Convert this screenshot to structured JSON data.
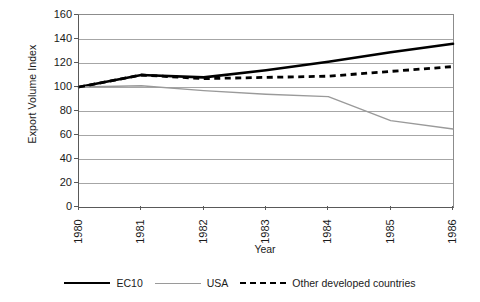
{
  "chart_data": {
    "type": "line",
    "title": "",
    "xlabel": "Year",
    "ylabel": "Export Volume Index",
    "x": [
      1980,
      1981,
      1982,
      1983,
      1984,
      1985,
      1986
    ],
    "categories": [
      "1980",
      "1981",
      "1982",
      "1983",
      "1984",
      "1985",
      "1986"
    ],
    "xlim": [
      1980,
      1986
    ],
    "ylim": [
      0,
      160
    ],
    "yticks": [
      0,
      20,
      40,
      60,
      80,
      100,
      120,
      140,
      160
    ],
    "ytick_labels": [
      "0",
      "20",
      "40",
      "60",
      "80",
      "100",
      "120",
      "140",
      "160"
    ],
    "grid": true,
    "grid_axis": "y",
    "legend_position": "bottom",
    "series": [
      {
        "name": "EC10",
        "values": [
          100,
          110,
          108,
          114,
          121,
          129,
          136
        ],
        "color": "#000000",
        "style": "solid",
        "width": 2.6
      },
      {
        "name": "USA",
        "values": [
          100,
          101,
          97,
          94,
          92,
          72,
          65
        ],
        "color": "#9a9a9a",
        "style": "solid",
        "width": 1.4
      },
      {
        "name": "Other developed countries",
        "values": [
          100,
          110,
          107,
          108,
          109,
          113,
          117
        ],
        "color": "#000000",
        "style": "dashed",
        "width": 2.8
      }
    ]
  },
  "axes": {
    "y_title": "Export Volume Index",
    "x_title": "Year",
    "y_tick_labels": [
      "160",
      "140",
      "120",
      "100",
      "80",
      "60",
      "40",
      "20",
      "0"
    ],
    "x_tick_labels": [
      "1980",
      "1981",
      "1982",
      "1983",
      "1984",
      "1985",
      "1986"
    ]
  },
  "legend": {
    "items": [
      {
        "label": "EC10"
      },
      {
        "label": "USA"
      },
      {
        "label": "Other developed countries"
      }
    ]
  },
  "colors": {
    "ec10": "#000000",
    "usa": "#9a9a9a",
    "other": "#000000",
    "gridline": "#a6a6a6",
    "axis": "#595959",
    "frame": "#8c8c8c",
    "text": "#1a1a1a",
    "background": "#ffffff"
  }
}
